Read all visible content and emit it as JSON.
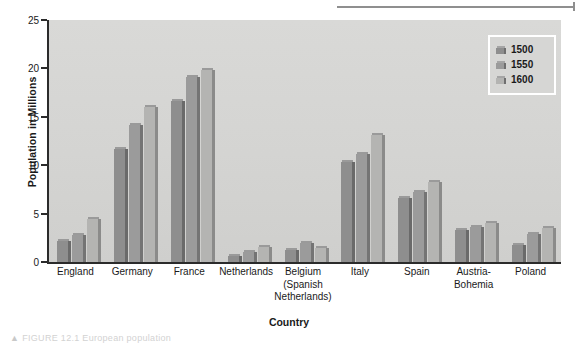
{
  "figure": {
    "caption_stub": "FIGURE 12.1  European population",
    "caption_marker": "▲"
  },
  "chart_data": {
    "type": "bar",
    "title": "",
    "xlabel": "Country",
    "ylabel": "Population in Millions",
    "ylim": [
      0,
      25
    ],
    "yticks": [
      0,
      5,
      10,
      15,
      20,
      25
    ],
    "grid": false,
    "legend_position": "top-right",
    "categories": [
      "England",
      "Germany",
      "France",
      "Netherlands",
      "Belgium\n(Spanish\nNetherlands)",
      "Italy",
      "Spain",
      "Austria-\nBohemia",
      "Poland"
    ],
    "series": [
      {
        "name": "1500",
        "color": "#8e8e8e",
        "values": [
          2.2,
          11.7,
          16.6,
          0.6,
          1.2,
          10.3,
          6.6,
          3.3,
          1.8
        ]
      },
      {
        "name": "1550",
        "color": "#9b9b9b",
        "values": [
          2.8,
          14.2,
          19.1,
          1.0,
          2.0,
          11.2,
          7.2,
          3.6,
          2.9
        ]
      },
      {
        "name": "1600",
        "color": "#b4b4b2",
        "values": [
          4.4,
          16.0,
          19.8,
          1.5,
          1.4,
          13.1,
          8.3,
          4.0,
          3.5
        ]
      }
    ]
  }
}
